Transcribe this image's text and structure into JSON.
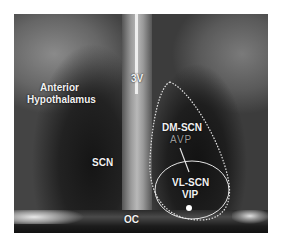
{
  "figure": {
    "type": "micrograph",
    "labels": {
      "anterior_hypothalamus_line1": "Anterior",
      "anterior_hypothalamus_line2": "Hypothalamus",
      "third_ventricle": "3V",
      "scn": "SCN",
      "dm_scn": "DM-SCN",
      "avp": "AVP",
      "vl_scn": "VL-SCN",
      "vip": "VIP",
      "optic_chiasm": "OC"
    },
    "colors": {
      "label_text": "#f2f2f2",
      "avp_text": "#9a9a9a",
      "outline": "#e6e6e6",
      "background": "#ffffff"
    }
  }
}
